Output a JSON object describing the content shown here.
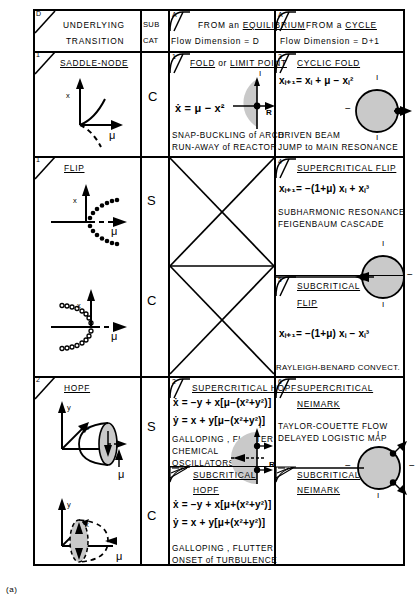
{
  "figure": {
    "caption": "(a)"
  },
  "header": {
    "col1": {
      "flag": "D",
      "line1": "UNDERLYING",
      "line2": "TRANSITION"
    },
    "col2": {
      "line1": "SUB",
      "line2": "CAT"
    },
    "col3": {
      "flag": "A",
      "line1_a": "FROM an ",
      "line1_b": "EQUILIBRIUM",
      "line2": "Flow Dimension = D"
    },
    "col4": {
      "flag": "A",
      "line1_a": "FROM a ",
      "line1_b": "CYCLE",
      "line2": "Flow Dimension = D+1"
    }
  },
  "rows": [
    {
      "name": "saddle-node-row",
      "left": {
        "flag": "1",
        "title": "SADDLE-NODE",
        "axis_x": "x",
        "axis_mu": "μ"
      },
      "subcat": [
        "C"
      ],
      "equilibrium": {
        "flag": "1",
        "title_a": "FOLD",
        "title_mid": " or ",
        "title_b": "LIMIT POINT",
        "equation": "ẋ = μ − x²",
        "examples": [
          "SNAP-BUCKLING of ARCH",
          "RUN-AWAY of REACTOR"
        ],
        "eigen_labels": {
          "imag": "I",
          "real": "R"
        }
      },
      "cycle": {
        "flag": "3",
        "title": "CYCLIC FOLD",
        "equation": "xᵢ₊₁= xᵢ + μ − xᵢ²",
        "examples": [
          "DRIVEN BEAM",
          "JUMP to MAIN RESONANCE"
        ],
        "circle_labels": {
          "top": "I",
          "bottom": "I",
          "left": "−"
        }
      }
    },
    {
      "name": "flip-row",
      "left": {
        "flag": "1",
        "title": "FLIP",
        "axis_x": "x",
        "axis_mu": "μ"
      },
      "subcat": [
        "S",
        "C"
      ],
      "cycle_super": {
        "flag": "4",
        "title": "SUPERCRITICAL FLIP",
        "equation": "xᵢ₊₁= −(1+μ) xᵢ + xᵢ³",
        "examples": [
          "SUBHARMONIC RESONANCE",
          "FEIGENBAUM CASCADE"
        ]
      },
      "cycle_sub": {
        "flag": "5",
        "title_line1": "SUBCRITICAL",
        "title_line2": "FLIP",
        "equation": "xᵢ₊₁= −(1+μ) xᵢ − xᵢ³",
        "examples": [
          "RAYLEIGH-BENARD CONVECT."
        ]
      }
    },
    {
      "name": "hopf-row",
      "left": {
        "flag": "2",
        "title": "HOPF",
        "axis_y": "y",
        "axis_x": "x",
        "axis_mu": "μ"
      },
      "subcat": [
        "S",
        "C"
      ],
      "equilibrium_super": {
        "flag": "2",
        "title": "SUPERCRITICAL HOPF",
        "equation1": "ẋ = −y + x[μ−(x²+y²)]",
        "equation2": "ẏ =  x + y[μ−(x²+y²)]",
        "examples": [
          "GALLOPING , FLUTTER",
          "CHEMICAL",
          "OSCILLATORS"
        ],
        "eigen_labels": {
          "imag": "I",
          "real": "R"
        }
      },
      "equilibrium_sub": {
        "title_line1": "SUBCRITICAL",
        "title_line2": "HOPF",
        "equation1": "ẋ = −y + x[μ+(x²+y²)]",
        "equation2": "ẏ =  x + y[μ+(x²+y²)]",
        "examples": [
          "GALLOPING , FLUTTER",
          "ONSET of TURBULENCE"
        ]
      },
      "cycle_super": {
        "flag": "6",
        "title_line1": "SUPERCRITICAL",
        "title_line2": "NEIMARK",
        "examples": [
          "TAYLOR-COUETTE FLOW",
          "DELAYED LOGISTIC MAP"
        ],
        "circle_labels": {
          "top": "I",
          "bottom": "I",
          "left": "−",
          "right": "−"
        }
      },
      "cycle_sub": {
        "title_line1": "SUBCRITICAL",
        "title_line2": "NEIMARK"
      }
    }
  ],
  "colors": {
    "ink": "#000000",
    "shade": "#c9c9c9",
    "paper": "#ffffff"
  }
}
